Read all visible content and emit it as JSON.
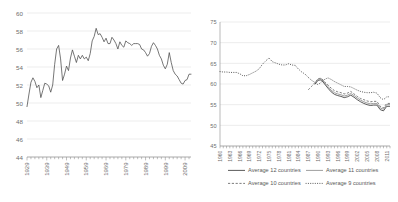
{
  "chart_data": [
    {
      "type": "line",
      "id": "left-chart",
      "title": "",
      "xlabel": "",
      "ylabel": "",
      "ylim": [
        44,
        60
      ],
      "yticks": [
        44,
        46,
        48,
        50,
        52,
        54,
        56,
        58,
        60
      ],
      "xlim": [
        1929,
        2012
      ],
      "xticks": [
        1929,
        1939,
        1949,
        1959,
        1969,
        1979,
        1989,
        1999,
        2009
      ],
      "grid": true,
      "legend": "none",
      "series": [
        {
          "name": "series-1",
          "style": "solid",
          "x": [
            1929,
            1930,
            1931,
            1932,
            1933,
            1934,
            1935,
            1936,
            1937,
            1938,
            1939,
            1940,
            1941,
            1942,
            1943,
            1944,
            1945,
            1946,
            1947,
            1948,
            1949,
            1950,
            1951,
            1952,
            1953,
            1954,
            1955,
            1956,
            1957,
            1958,
            1959,
            1960,
            1961,
            1962,
            1963,
            1964,
            1965,
            1966,
            1967,
            1968,
            1969,
            1970,
            1971,
            1972,
            1973,
            1974,
            1975,
            1976,
            1977,
            1978,
            1979,
            1980,
            1981,
            1982,
            1983,
            1984,
            1985,
            1986,
            1987,
            1988,
            1989,
            1990,
            1991,
            1992,
            1993,
            1994,
            1995,
            1996,
            1997,
            1998,
            1999,
            2000,
            2001,
            2002,
            2003,
            2004,
            2005,
            2006,
            2007,
            2008,
            2009,
            2010,
            2011,
            2012
          ],
          "values": [
            49.6,
            51.0,
            52.3,
            52.8,
            52.4,
            51.7,
            52.0,
            50.6,
            51.4,
            52.2,
            52.1,
            51.9,
            51.2,
            52.0,
            54.3,
            56.0,
            56.4,
            54.9,
            52.5,
            53.2,
            54.1,
            53.6,
            55.0,
            55.9,
            55.2,
            54.5,
            55.3,
            54.9,
            55.3,
            54.9,
            55.1,
            54.7,
            55.5,
            56.9,
            57.4,
            58.3,
            57.6,
            57.7,
            57.3,
            56.8,
            57.2,
            56.6,
            56.6,
            57.3,
            57.0,
            56.6,
            56.0,
            56.8,
            56.4,
            56.2,
            56.9,
            56.7,
            56.6,
            56.4,
            56.6,
            56.6,
            56.6,
            56.5,
            56.0,
            55.9,
            55.6,
            55.2,
            55.5,
            56.3,
            56.7,
            56.4,
            56.0,
            55.3,
            54.9,
            54.2,
            53.8,
            54.3,
            55.6,
            54.5,
            53.6,
            53.2,
            53.0,
            52.6,
            52.2,
            52.1,
            52.5,
            52.6,
            53.2,
            53.2
          ]
        }
      ]
    },
    {
      "type": "line",
      "id": "right-chart",
      "title": "",
      "xlabel": "",
      "ylabel": "",
      "ylim": [
        45,
        75
      ],
      "yticks": [
        45,
        50,
        55,
        60,
        65,
        70,
        75
      ],
      "xlim": [
        1960,
        2012
      ],
      "xticks": [
        1960,
        1963,
        1966,
        1969,
        1972,
        1975,
        1978,
        1981,
        1984,
        1987,
        1990,
        1993,
        1996,
        1999,
        2002,
        2005,
        2008,
        2011
      ],
      "grid": true,
      "legend": "bottom",
      "series": [
        {
          "name": "Average 9 countries",
          "style": "dotted",
          "x": [
            1960,
            1961,
            1962,
            1963,
            1964,
            1965,
            1966,
            1967,
            1968,
            1969,
            1970,
            1971,
            1972,
            1973,
            1974,
            1975,
            1976,
            1977,
            1978,
            1979,
            1980,
            1981,
            1982,
            1983,
            1984,
            1985,
            1986,
            1987,
            1988,
            1989,
            1990,
            1991,
            1992,
            1993,
            1994,
            1995,
            1996,
            1997,
            1998,
            1999,
            2000,
            2001,
            2002,
            2003,
            2004,
            2005,
            2006,
            2007,
            2008,
            2009,
            2010,
            2011,
            2012
          ],
          "values": [
            63.0,
            62.9,
            62.9,
            62.8,
            62.8,
            62.8,
            62.5,
            62.0,
            62.0,
            62.3,
            62.7,
            63.1,
            63.7,
            64.8,
            65.6,
            66.3,
            65.4,
            65.1,
            64.8,
            64.6,
            64.6,
            64.9,
            64.6,
            64.5,
            63.6,
            62.9,
            62.4,
            61.6,
            60.9,
            60.4,
            59.8,
            60.5,
            61.1,
            61.5,
            61.1,
            60.6,
            60.2,
            59.8,
            59.4,
            59.4,
            59.3,
            58.9,
            58.5,
            58.2,
            58.0,
            57.9,
            57.9,
            58.0,
            57.8,
            56.7,
            56.2,
            56.9,
            56.9
          ]
        },
        {
          "name": "Average 10 countries",
          "style": "dashed",
          "x": [
            1987,
            1988,
            1989,
            1990,
            1991,
            1992,
            1993,
            1994,
            1995,
            1996,
            1997,
            1998,
            1999,
            2000,
            2001,
            2002,
            2003,
            2004,
            2005,
            2006,
            2007,
            2008,
            2009,
            2010,
            2011,
            2012
          ],
          "values": [
            58.6,
            59.4,
            60.3,
            61.3,
            61.4,
            60.5,
            59.8,
            59.0,
            58.4,
            58.1,
            57.9,
            57.6,
            57.8,
            58.2,
            57.6,
            57.0,
            56.5,
            56.2,
            55.9,
            55.7,
            55.8,
            55.8,
            54.6,
            54.2,
            55.3,
            55.3
          ]
        },
        {
          "name": "Average 11 countries",
          "style": "solid-gray",
          "x": [
            1989,
            1990,
            1991,
            1992,
            1993,
            1994,
            1995,
            1996,
            1997,
            1998,
            1999,
            2000,
            2001,
            2002,
            2003,
            2004,
            2005,
            2006,
            2007,
            2008,
            2009,
            2010,
            2011,
            2012
          ],
          "values": [
            60.2,
            61.2,
            61.3,
            60.3,
            59.4,
            58.5,
            57.9,
            57.6,
            57.4,
            57.1,
            57.3,
            57.7,
            57.2,
            56.6,
            56.1,
            55.7,
            55.4,
            55.2,
            55.3,
            55.3,
            54.2,
            53.9,
            55.0,
            55.0
          ]
        },
        {
          "name": "Average 12 countries",
          "style": "solid-dark",
          "x": [
            1989,
            1990,
            1991,
            1992,
            1993,
            1994,
            1995,
            1996,
            1997,
            1998,
            1999,
            2000,
            2001,
            2002,
            2003,
            2004,
            2005,
            2006,
            2007,
            2008,
            2009,
            2010,
            2011,
            2012
          ],
          "values": [
            59.9,
            60.9,
            61.0,
            60.0,
            59.0,
            58.1,
            57.5,
            57.2,
            57.0,
            56.7,
            56.9,
            57.3,
            56.8,
            56.2,
            55.7,
            55.3,
            55.0,
            54.8,
            54.9,
            54.9,
            53.8,
            53.5,
            54.6,
            54.6
          ]
        }
      ],
      "legend_entries": [
        {
          "label": "Average 12 countries",
          "style": "solid-dark"
        },
        {
          "label": "Average 11 countries",
          "style": "solid-gray"
        },
        {
          "label": "Average 10 countries",
          "style": "dashed"
        },
        {
          "label": "Average 9 countries",
          "style": "dotted"
        }
      ]
    }
  ]
}
